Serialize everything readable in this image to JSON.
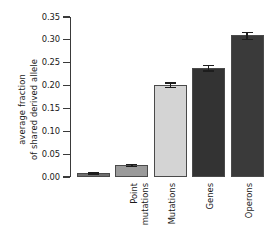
{
  "chart_data": {
    "type": "bar",
    "title": "",
    "xlabel": "",
    "ylabel": "average fraction\nof shared derived allele",
    "ylabel_line1": "average fraction",
    "ylabel_line2": "of shared derived allele",
    "categories": [
      "Point\nmutations",
      "Mutations",
      "Genes",
      "Operons",
      "Functional\nunits"
    ],
    "values": [
      0.009,
      0.027,
      0.202,
      0.239,
      0.31
    ],
    "errors": [
      0.001,
      0.002,
      0.005,
      0.006,
      0.008
    ],
    "ylim": [
      0.0,
      0.35
    ],
    "yticks": [
      0.0,
      0.05,
      0.1,
      0.15,
      0.2,
      0.25,
      0.3,
      0.35
    ],
    "ytick_labels": [
      "0.00",
      "0.05",
      "0.10",
      "0.15",
      "0.20",
      "0.25",
      "0.30",
      "0.35"
    ],
    "bar_colors": [
      "#6e6e6e",
      "#9a9a9a",
      "#d4d4d4",
      "#333333",
      "#3a3a3a"
    ],
    "grid": false,
    "legend": false
  },
  "axis": {
    "spine_color": "#3a3a3a",
    "error_color": "#1d1d1d"
  }
}
